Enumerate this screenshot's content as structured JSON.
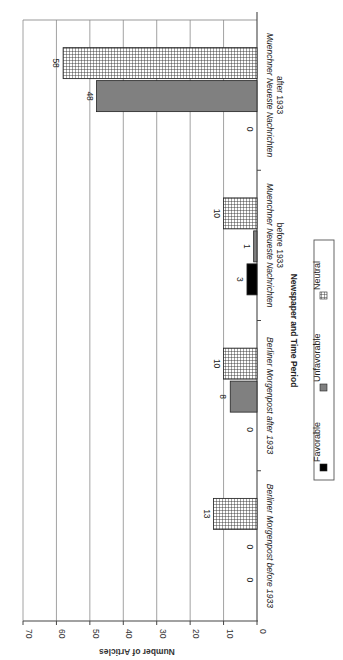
{
  "chart_data": {
    "type": "bar",
    "orientation": "rotated-90-clockwise (vertical grouped bars displayed sideways)",
    "title": "",
    "xlabel": "Newspaper and Time Period",
    "ylabel": "Number of Articles",
    "ylim": [
      0,
      70
    ],
    "yticks": [
      0,
      10,
      20,
      30,
      40,
      50,
      60,
      70
    ],
    "grid": true,
    "legend_position": "bottom",
    "categories": [
      "Berliner Morgenpost before 1933",
      "Berliner Morgenpost after 1933",
      "Muenchner Neueste Nachrichten before 1933",
      "Muenchner Neueste Nachrichten after 1933"
    ],
    "category_lines": [
      [
        "Berliner Morgenpost before 1933"
      ],
      [
        "Berliner Morgenpost after 1933"
      ],
      [
        "Muenchner Neueste Nachrichten",
        "before 1933"
      ],
      [
        "Muenchner Neueste Nachrichten",
        "after 1933"
      ]
    ],
    "series": [
      {
        "name": "Favorable",
        "values": [
          0,
          0,
          3,
          0
        ],
        "fill": "#000000",
        "pattern": "solid"
      },
      {
        "name": "Unfavorable",
        "values": [
          0,
          8,
          1,
          48
        ],
        "fill": "#808080",
        "pattern": "solid"
      },
      {
        "name": "Neutral",
        "values": [
          13,
          10,
          10,
          58
        ],
        "fill": "#ffffff",
        "pattern": "grid"
      }
    ]
  },
  "legend": {
    "items": [
      {
        "label": "Favorable",
        "swatch": "solid-black"
      },
      {
        "label": "Unfavorable",
        "swatch": "solid-gray"
      },
      {
        "label": "Neutral",
        "swatch": "grid-pattern"
      }
    ]
  },
  "colors": {
    "favorable": "#000000",
    "unfavorable": "#808080",
    "neutral_bg": "#ffffff",
    "neutral_grid": "#333333",
    "gridline": "#888888",
    "axis": "#444444"
  }
}
